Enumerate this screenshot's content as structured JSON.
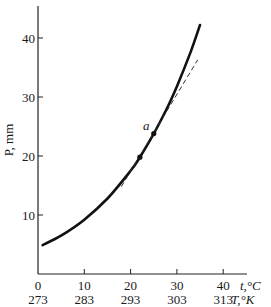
{
  "chart_data": {
    "type": "line",
    "title": "",
    "xlabel": "t,°C",
    "xlabel_secondary": "T,°K",
    "ylabel": "P, mm",
    "xlim": [
      0,
      45
    ],
    "ylim": [
      0,
      45
    ],
    "x_ticks": [
      0,
      10,
      20,
      30,
      40
    ],
    "x_tick_labels": [
      "0",
      "10",
      "20",
      "30",
      "40"
    ],
    "x_secondary_tick_labels": [
      "273",
      "283",
      "293",
      "303",
      "313"
    ],
    "y_ticks": [
      10,
      20,
      30,
      40
    ],
    "y_tick_labels": [
      "10",
      "20",
      "30",
      "40"
    ],
    "grid": false,
    "legend": null,
    "series": [
      {
        "name": "vapor pressure curve",
        "style": "solid",
        "x": [
          1,
          5,
          10,
          15,
          20,
          22,
          25,
          28,
          30,
          33,
          35
        ],
        "y": [
          4.9,
          6.5,
          9.2,
          12.8,
          17.5,
          19.8,
          23.8,
          28.3,
          31.8,
          37.7,
          42.2
        ]
      },
      {
        "name": "tangent at a",
        "style": "dashed",
        "x": [
          18,
          34.5
        ],
        "y": [
          14.8,
          36.3
        ]
      }
    ],
    "points": [
      {
        "label": "",
        "x": 22,
        "y": 19.8
      },
      {
        "label": "a",
        "x": 25,
        "y": 23.8
      }
    ],
    "annotations": [
      {
        "text": "a",
        "x": 24,
        "y": 25
      }
    ]
  }
}
